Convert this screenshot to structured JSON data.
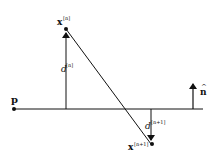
{
  "diagram": {
    "type": "geometry",
    "colors": {
      "stroke": "#111111",
      "background": "#ffffff"
    },
    "labels": {
      "point_p": "p",
      "point_xn_base": "x",
      "point_xn_sup": "[n]",
      "point_xn1_base": "x",
      "point_xn1_sup": "[n+1]",
      "dist_n_base": "d",
      "dist_n_sup": "[n]",
      "dist_n1_base": "d",
      "dist_n1_sup": "[n+1]",
      "normal_base": "n",
      "normal_hat": "^"
    },
    "elements": [
      {
        "id": "plane-line",
        "kind": "line",
        "from": [
          13,
          109
        ],
        "to": [
          203,
          109
        ]
      },
      {
        "id": "point-p",
        "kind": "point",
        "at": [
          14,
          109
        ]
      },
      {
        "id": "point-xn",
        "kind": "point",
        "at": [
          66,
          29
        ]
      },
      {
        "id": "point-xn1",
        "kind": "point",
        "at": [
          151,
          144
        ]
      },
      {
        "id": "distance-dn",
        "kind": "arrow",
        "from": [
          66,
          109
        ],
        "to": [
          66,
          31
        ]
      },
      {
        "id": "connector",
        "kind": "line",
        "from": [
          66,
          29
        ],
        "to": [
          151,
          144
        ]
      },
      {
        "id": "distance-dn1",
        "kind": "arrow",
        "from": [
          151,
          109
        ],
        "to": [
          151,
          141
        ]
      },
      {
        "id": "normal",
        "kind": "arrow",
        "from": [
          193,
          109
        ],
        "to": [
          193,
          82
        ]
      }
    ]
  }
}
